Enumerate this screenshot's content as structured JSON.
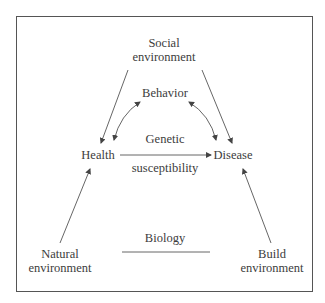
{
  "diagram": {
    "nodes": {
      "social": [
        "Social",
        "environment"
      ],
      "behavior": "Behavior",
      "genetic": "Genetic",
      "health": "Health",
      "disease": "Disease",
      "susceptibility": "susceptibility",
      "biology": "Biology",
      "natural": [
        "Natural",
        "environment"
      ],
      "build": [
        "Build",
        "environment"
      ]
    },
    "edges": [
      {
        "from": "Social environment",
        "to": "Health",
        "type": "arrow"
      },
      {
        "from": "Social environment",
        "to": "Disease",
        "type": "arrow"
      },
      {
        "from": "Behavior",
        "to": "Health",
        "type": "bidirectional-curve"
      },
      {
        "from": "Behavior",
        "to": "Disease",
        "type": "bidirectional-curve"
      },
      {
        "from": "Health",
        "to": "Disease",
        "type": "arrow",
        "label": "Genetic susceptibility"
      },
      {
        "from": "Natural environment",
        "to": "Health",
        "type": "arrow"
      },
      {
        "from": "Build environment",
        "to": "Disease",
        "type": "arrow"
      },
      {
        "from": "Natural environment",
        "to": "Build environment",
        "type": "line",
        "label": "Biology"
      }
    ],
    "colors": {
      "line": "#555555",
      "text": "#3c3c3c",
      "frame": "#555555"
    }
  }
}
